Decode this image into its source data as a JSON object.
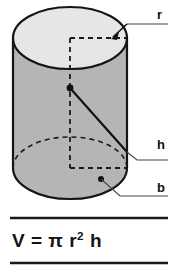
{
  "diagram": {
    "shape": "cylinder",
    "labels": {
      "radius": "r",
      "height": "h",
      "base": "b"
    },
    "formula": {
      "lhs": "V",
      "equals": "=",
      "pi": "π",
      "radius_var": "r",
      "exponent": "2",
      "height_var": "h",
      "full_text": "V = π r2 h"
    },
    "colors": {
      "top_face": "#e6e6e6",
      "body": "#b5b5b5",
      "outline": "#151515",
      "text": "#111111",
      "background": "#ffffff"
    },
    "geometry": {
      "cylinder_left": 13,
      "cylinder_right": 127,
      "ellipse_top": 7,
      "ellipse_rx": 57,
      "ellipse_ry": 31,
      "body_bottom": 199,
      "center_point_x": 70,
      "center_point_y": 88
    },
    "rules": {
      "top_rule_y": 218,
      "bottom_rule_y": 263,
      "rule_left": 10,
      "rule_right": 168
    }
  }
}
